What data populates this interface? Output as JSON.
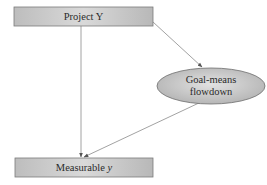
{
  "diagram": {
    "nodes": [
      {
        "id": "project",
        "shape": "rectangle",
        "label": "Project Y"
      },
      {
        "id": "flowdown",
        "shape": "ellipse",
        "label_line1": "Goal-means",
        "label_line2": "flowdown"
      },
      {
        "id": "measurable",
        "shape": "rectangle",
        "label_main": "Measurable ",
        "label_var": "y"
      }
    ],
    "edges": [
      {
        "from": "project",
        "to": "flowdown"
      },
      {
        "from": "project",
        "to": "measurable"
      },
      {
        "from": "flowdown",
        "to": "measurable"
      }
    ],
    "colors": {
      "box_fill_light": "#d6d6d6",
      "box_fill_dark": "#b4b4b4",
      "border": "#7a7a7a",
      "edge": "#8a8a8a",
      "text": "#2a2a2a"
    }
  }
}
